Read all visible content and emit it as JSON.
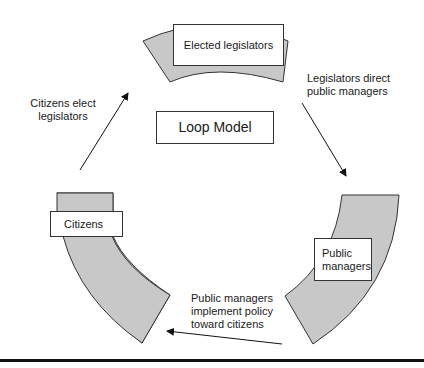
{
  "diagram": {
    "title": "Loop Model",
    "nodes": [
      {
        "id": "legislators",
        "label": "Elected legislators"
      },
      {
        "id": "managers",
        "label": "Public managers"
      },
      {
        "id": "citizens",
        "label": "Citizens"
      }
    ],
    "edges": [
      {
        "from": "citizens",
        "to": "legislators",
        "label_line1": "Citizens elect",
        "label_line2": "legislators"
      },
      {
        "from": "legislators",
        "to": "managers",
        "label_line1": "Legislators direct",
        "label_line2": "public managers"
      },
      {
        "from": "managers",
        "to": "citizens",
        "label_line1": "Public managers",
        "label_line2": "implement policy",
        "label_line3": "toward citizens"
      }
    ],
    "colors": {
      "band_fill": "#c8c8c8",
      "stroke": "#333333",
      "background": "#ffffff"
    }
  }
}
